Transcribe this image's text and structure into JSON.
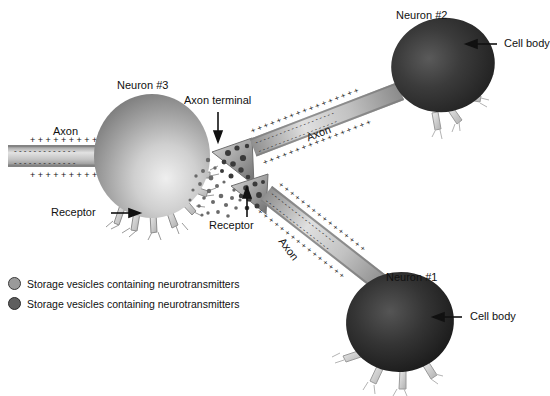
{
  "figure": {
    "title_present": false,
    "background_color": "#ffffff",
    "style": "grayscale airbrush scientific illustration"
  },
  "labels": {
    "neuron2": "Neuron #2",
    "neuron3": "Neuron #3",
    "neuron1": "Neuron #1",
    "cell_body_top": "Cell body",
    "cell_body_bottom": "Cell body",
    "axon_left": "Axon",
    "axon_upper_diagonal": "Axon",
    "axon_lower_diagonal": "Axon",
    "axon_terminal": "Axon terminal",
    "receptor_left": "Receptor",
    "receptor_center": "Receptor"
  },
  "legend": {
    "items": [
      {
        "label": "Storage vesicles containing neurotransmitters",
        "color": "#9a9a9a",
        "stroke": "#3a3a3a"
      },
      {
        "label": "Storage vesicles containing neurotransmitters",
        "color": "#5e5e5e",
        "stroke": "#2a2a2a"
      }
    ]
  },
  "colors": {
    "cell_body_dark": "#2b2b2b",
    "cell_body_light": "#9d9d9d",
    "axon_fiber": "#b9b9b9",
    "dendrite": "#cfcfcf",
    "ink": "#111111",
    "background": "#ffffff"
  },
  "membrane_charges": {
    "outer_symbol": "+",
    "inner_symbol": "-",
    "description": "Axon membrane shows plus charges outside and minus charges inside"
  },
  "neurons": [
    {
      "name": "Neuron #1",
      "position": "bottom-right",
      "shade": "dark"
    },
    {
      "name": "Neuron #2",
      "position": "top-right",
      "shade": "dark"
    },
    {
      "name": "Neuron #3",
      "position": "center-left",
      "shade": "light"
    }
  ]
}
